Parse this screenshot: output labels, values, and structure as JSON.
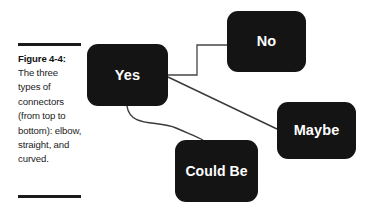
{
  "figure": {
    "caption": {
      "label": "Figure 4-4:",
      "text": " The three types of connectors (from top to bottom): elbow, straight, and curved."
    },
    "background_color": "#ffffff",
    "node_color": "#141414",
    "node_text_color": "#ffffff",
    "connector_color": "#3a3a3a",
    "rule_color": "#1a1a1a"
  },
  "diagram": {
    "nodes": [
      {
        "id": "yes",
        "label": "Yes"
      },
      {
        "id": "no",
        "label": "No"
      },
      {
        "id": "maybe",
        "label": "Maybe"
      },
      {
        "id": "could_be",
        "label": "Could Be"
      }
    ],
    "connectors": [
      {
        "id": "elbow",
        "type": "elbow",
        "from": "yes",
        "to": "no"
      },
      {
        "id": "straight",
        "type": "straight",
        "from": "yes",
        "to": "maybe"
      },
      {
        "id": "curved",
        "type": "curved",
        "from": "yes",
        "to": "could_be"
      }
    ]
  }
}
